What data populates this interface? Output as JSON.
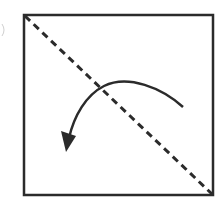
{
  "diagram": {
    "type": "fold-instruction",
    "colors": {
      "background": "#ffffff",
      "stroke": "#2b2b2b"
    },
    "square": {
      "x": 23,
      "y": 14,
      "width": 191,
      "height": 182
    },
    "fold_line": {
      "style": "dashed",
      "from": [
        24,
        15
      ],
      "to": [
        213,
        195
      ]
    },
    "arrow": {
      "path": "M183,107 C160,88 128,74 104,86 C84,96 72,118 68,140",
      "head": [
        66,
        150
      ]
    }
  }
}
